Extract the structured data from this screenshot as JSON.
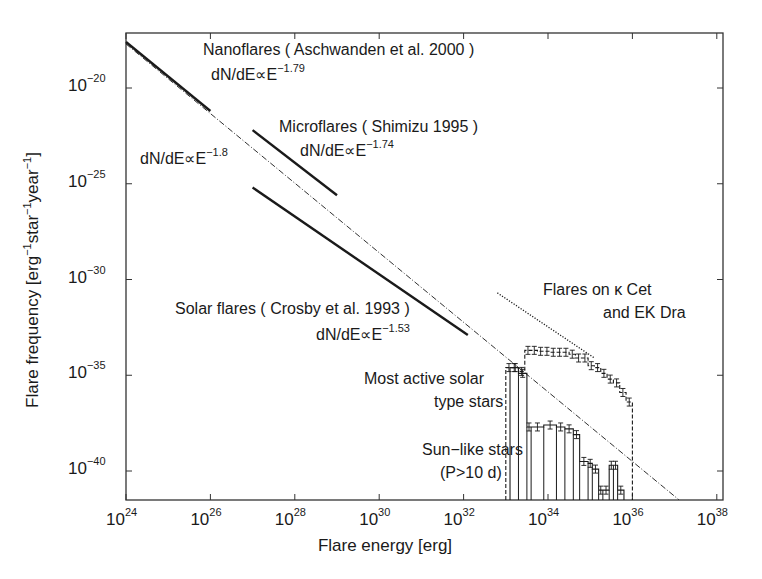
{
  "chart_data": {
    "type": "line",
    "title": "",
    "xlabel": "Flare energy [erg]",
    "ylabel": "Flare frequency [erg⁻¹star⁻¹year⁻¹]",
    "xscale": "log",
    "yscale": "log",
    "xlim": [
      1e+24,
      1e+38
    ],
    "ylim": [
      3e-42,
      1e-17
    ],
    "grid": false,
    "x_ticks": [
      {
        "base": "10",
        "exp": "24"
      },
      {
        "base": "10",
        "exp": "26"
      },
      {
        "base": "10",
        "exp": "28"
      },
      {
        "base": "10",
        "exp": "30"
      },
      {
        "base": "10",
        "exp": "32"
      },
      {
        "base": "10",
        "exp": "34"
      },
      {
        "base": "10",
        "exp": "36"
      },
      {
        "base": "10",
        "exp": "38"
      }
    ],
    "y_ticks": [
      {
        "base": "10",
        "exp": "−20"
      },
      {
        "base": "10",
        "exp": "−25"
      },
      {
        "base": "10",
        "exp": "−30"
      },
      {
        "base": "10",
        "exp": "−35"
      },
      {
        "base": "10",
        "exp": "−40"
      }
    ],
    "series": [
      {
        "name": "Nanoflares (Aschwanden et al. 2000)",
        "style": "solid-thick",
        "power_law_index": -1.79,
        "log_x": [
          24.0,
          26.0
        ],
        "log_y": [
          -17.6,
          -21.2
        ]
      },
      {
        "name": "Microflares (Shimizu 1995)",
        "style": "solid-thick",
        "power_law_index": -1.74,
        "log_x": [
          27.0,
          29.0
        ],
        "log_y": [
          -22.2,
          -25.6
        ]
      },
      {
        "name": "Solar flares (Crosby et al. 1993)",
        "style": "solid-thick",
        "power_law_index": -1.53,
        "log_x": [
          27.0,
          32.1
        ],
        "log_y": [
          -25.2,
          -32.9
        ]
      },
      {
        "name": "dN/dE ∝ E^-1.8 reference",
        "style": "dash-dot",
        "power_law_index": -1.8,
        "log_x": [
          24.0,
          37.1
        ],
        "log_y": [
          -17.7,
          -41.5
        ]
      },
      {
        "name": "Flares on κ Cet and EK Dra",
        "style": "dotted",
        "log_x": [
          32.8,
          35.1
        ],
        "log_y": [
          -30.7,
          -34.1
        ]
      },
      {
        "name": "Most active solar type stars",
        "style": "dashed-histogram",
        "bins_log_x": [
          33.0,
          33.15,
          33.3,
          33.45,
          33.6,
          33.75,
          33.9,
          34.05,
          34.2,
          34.35,
          34.5,
          34.65,
          34.8,
          34.95,
          35.1,
          35.25,
          35.4,
          35.55,
          35.7,
          35.85,
          36.0
        ],
        "log_y": [
          -34.6,
          -34.6,
          -34.8,
          -33.7,
          -33.7,
          -33.75,
          -33.75,
          -33.8,
          -33.8,
          -33.8,
          -33.9,
          -34.1,
          -34.1,
          -34.5,
          -34.6,
          -34.9,
          -35.2,
          -35.4,
          -35.9,
          -36.4
        ]
      },
      {
        "name": "Sun-like stars (P>10 d)",
        "style": "solid-histogram",
        "bins_log_x": [
          33.1,
          33.3,
          33.5,
          33.6,
          33.9,
          34.2,
          34.4,
          34.6,
          34.75,
          34.95,
          35.05,
          35.2,
          35.3,
          35.45,
          35.55,
          35.65,
          35.8
        ],
        "log_y": [
          -34.6,
          -34.9,
          -37.7,
          -37.7,
          -37.6,
          -37.7,
          -37.8,
          -38.1,
          -39.5,
          -39.6,
          -39.9,
          -41.0,
          -41.0,
          -39.7,
          -39.7,
          -41.0
        ],
        "note": "final bins are sparse; gaps present near 10^35.2"
      }
    ],
    "annotations": [
      {
        "id": "nano_title",
        "text": "Nanoflares ( Aschwanden et al. 2000 )"
      },
      {
        "id": "nano_law_base",
        "text": "dN/dE∝E"
      },
      {
        "id": "nano_law_exp",
        "text": "−1.79"
      },
      {
        "id": "ref_law_base",
        "text": "dN/dE∝E"
      },
      {
        "id": "ref_law_exp",
        "text": "−1.8"
      },
      {
        "id": "micro_title",
        "text": "Microflares ( Shimizu 1995 )"
      },
      {
        "id": "micro_law_base",
        "text": "dN/dE∝E"
      },
      {
        "id": "micro_law_exp",
        "text": "−1.74"
      },
      {
        "id": "solar_title",
        "text": "Solar flares ( Crosby et al. 1993 )"
      },
      {
        "id": "solar_law_base",
        "text": "dN/dE∝E"
      },
      {
        "id": "solar_law_exp",
        "text": "−1.53"
      },
      {
        "id": "kcet_line1",
        "text": "Flares on κ Cet"
      },
      {
        "id": "kcet_line2",
        "text": "and EK Dra"
      },
      {
        "id": "active_line1",
        "text": "Most active solar"
      },
      {
        "id": "active_line2",
        "text": "type stars"
      },
      {
        "id": "sunlike_line1",
        "text": "Sun−like stars"
      },
      {
        "id": "sunlike_line2",
        "text": "(P>10 d)"
      }
    ]
  },
  "labels": {
    "xlabel": "Flare energy [erg]",
    "ylabel_pre": "Flare frequency [erg",
    "ylabel_sup1": "−1",
    "ylabel_mid1": "star",
    "ylabel_sup2": "−1",
    "ylabel_mid2": "year",
    "ylabel_sup3": "−1",
    "ylabel_post": "]",
    "nano_title": "Nanoflares ( Aschwanden et al. 2000 )",
    "nano_law": "dN/dE∝E",
    "nano_exp": "−1.79",
    "ref_law": "dN/dE∝E",
    "ref_exp": "−1.8",
    "micro_title": "Microflares ( Shimizu 1995 )",
    "micro_law": "dN/dE∝E",
    "micro_exp": "−1.74",
    "solar_title": "Solar flares ( Crosby et al. 1993 )",
    "solar_law": "dN/dE∝E",
    "solar_exp": "−1.53",
    "kcet_line1": "Flares on κ Cet",
    "kcet_line2": "and EK Dra",
    "active_line1": "Most active solar",
    "active_line2": "type stars",
    "sunlike_line1": "Sun−like stars",
    "sunlike_line2": "(P>10 d)"
  },
  "colors": {
    "ink": "#1a1a1a",
    "axis": "#333333",
    "background": "#ffffff"
  }
}
